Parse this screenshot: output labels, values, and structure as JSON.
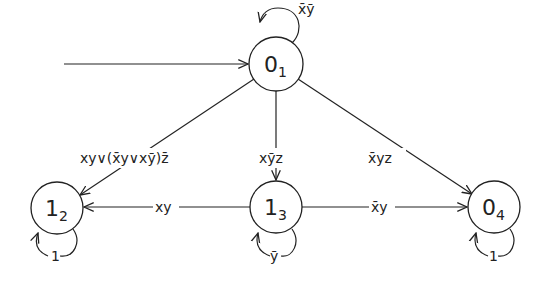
{
  "diagram": {
    "type": "state-machine",
    "start_arrow": {
      "to": "s1"
    },
    "nodes": [
      {
        "id": "s1",
        "main": "0",
        "sub": "1",
        "cx": 276,
        "cy": 64
      },
      {
        "id": "s2",
        "main": "1",
        "sub": "2",
        "cx": 57,
        "cy": 208
      },
      {
        "id": "s3",
        "main": "1",
        "sub": "3",
        "cx": 276,
        "cy": 207
      },
      {
        "id": "s4",
        "main": "0",
        "sub": "4",
        "cx": 494,
        "cy": 207
      }
    ],
    "edges": [
      {
        "from": "s1",
        "to": "s1",
        "label": "x̄ȳ"
      },
      {
        "from": "s1",
        "to": "s2",
        "label": "xy∨(x̄y∨xȳ)z̄"
      },
      {
        "from": "s1",
        "to": "s3",
        "label": "xȳz"
      },
      {
        "from": "s1",
        "to": "s4",
        "label": "x̄yz"
      },
      {
        "from": "s3",
        "to": "s2",
        "label": "xy"
      },
      {
        "from": "s3",
        "to": "s4",
        "label": "x̄y"
      },
      {
        "from": "s2",
        "to": "s2",
        "label": "1"
      },
      {
        "from": "s3",
        "to": "s3",
        "label": "ȳ"
      },
      {
        "from": "s4",
        "to": "s4",
        "label": "1"
      }
    ]
  }
}
